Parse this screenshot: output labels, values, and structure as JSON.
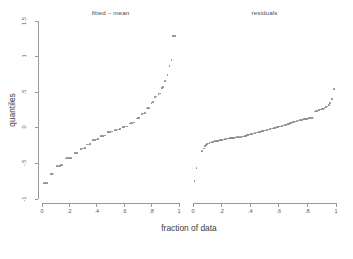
{
  "figure": {
    "y_axis_title": "quantiles",
    "x_axis_title": "fraction of data",
    "point_color": "#8e8e8e",
    "axis_color": "#9a9a9a"
  },
  "chart_data": {
    "type": "scatter",
    "title": "",
    "xlabel": "fraction of data",
    "ylabel": "quantiles",
    "xlim": [
      0,
      1
    ],
    "ylim": [
      -1,
      1.5
    ],
    "xticks": [
      0,
      0.2,
      0.4,
      0.6,
      0.8,
      1
    ],
    "xtick_labels": [
      "0",
      ".2",
      ".4",
      ".6",
      ".8",
      "1"
    ],
    "yticks": [
      -1,
      -0.5,
      0,
      0.5,
      1,
      1.5
    ],
    "ytick_labels": [
      "-1",
      "-.5",
      "0",
      ".5",
      "1",
      "1.5"
    ],
    "grid": false,
    "legend": "none",
    "panels": [
      {
        "label": "fitted – mean",
        "series_name": "fitted minus mean quantiles",
        "x": [
          0.01,
          0.02,
          0.03,
          0.04,
          0.065,
          0.075,
          0.085,
          0.11,
          0.12,
          0.13,
          0.14,
          0.15,
          0.175,
          0.185,
          0.195,
          0.205,
          0.215,
          0.24,
          0.25,
          0.26,
          0.285,
          0.295,
          0.305,
          0.315,
          0.33,
          0.34,
          0.35,
          0.37,
          0.38,
          0.39,
          0.4,
          0.41,
          0.43,
          0.44,
          0.45,
          0.46,
          0.48,
          0.49,
          0.5,
          0.51,
          0.53,
          0.54,
          0.55,
          0.56,
          0.57,
          0.59,
          0.6,
          0.61,
          0.62,
          0.64,
          0.65,
          0.66,
          0.67,
          0.69,
          0.7,
          0.71,
          0.73,
          0.74,
          0.75,
          0.765,
          0.775,
          0.785,
          0.8,
          0.81,
          0.825,
          0.835,
          0.85,
          0.86,
          0.875,
          0.885,
          0.9,
          0.915,
          0.93,
          0.945,
          0.955,
          0.965,
          0.975
        ],
        "y": [
          -0.775,
          -0.775,
          -0.775,
          -0.772,
          -0.645,
          -0.645,
          -0.643,
          -0.54,
          -0.538,
          -0.536,
          -0.52,
          -0.518,
          -0.43,
          -0.428,
          -0.426,
          -0.424,
          -0.422,
          -0.355,
          -0.353,
          -0.351,
          -0.295,
          -0.292,
          -0.29,
          -0.288,
          -0.235,
          -0.233,
          -0.23,
          -0.175,
          -0.172,
          -0.168,
          -0.165,
          -0.162,
          -0.118,
          -0.115,
          -0.112,
          -0.108,
          -0.06,
          -0.058,
          -0.055,
          -0.052,
          -0.03,
          -0.028,
          -0.025,
          -0.022,
          -0.02,
          0.012,
          0.015,
          0.018,
          0.02,
          0.06,
          0.065,
          0.07,
          0.075,
          0.13,
          0.135,
          0.14,
          0.195,
          0.2,
          0.205,
          0.27,
          0.275,
          0.282,
          0.35,
          0.36,
          0.43,
          0.44,
          0.47,
          0.48,
          0.56,
          0.575,
          0.66,
          0.745,
          0.87,
          0.95,
          1.285,
          1.29,
          1.292
        ]
      },
      {
        "label": "residuals",
        "series_name": "residual quantiles",
        "x": [
          0.01,
          0.025,
          0.065,
          0.075,
          0.085,
          0.092,
          0.1,
          0.108,
          0.115,
          0.122,
          0.13,
          0.138,
          0.145,
          0.153,
          0.16,
          0.168,
          0.175,
          0.183,
          0.19,
          0.198,
          0.205,
          0.213,
          0.22,
          0.228,
          0.235,
          0.243,
          0.25,
          0.258,
          0.265,
          0.273,
          0.28,
          0.288,
          0.295,
          0.303,
          0.31,
          0.318,
          0.325,
          0.333,
          0.34,
          0.348,
          0.355,
          0.363,
          0.37,
          0.378,
          0.385,
          0.393,
          0.4,
          0.408,
          0.415,
          0.423,
          0.43,
          0.438,
          0.445,
          0.453,
          0.46,
          0.468,
          0.475,
          0.483,
          0.49,
          0.498,
          0.505,
          0.513,
          0.52,
          0.528,
          0.535,
          0.543,
          0.55,
          0.558,
          0.565,
          0.573,
          0.58,
          0.588,
          0.595,
          0.603,
          0.61,
          0.618,
          0.625,
          0.633,
          0.64,
          0.648,
          0.655,
          0.663,
          0.67,
          0.678,
          0.685,
          0.693,
          0.7,
          0.708,
          0.715,
          0.723,
          0.73,
          0.738,
          0.745,
          0.753,
          0.76,
          0.768,
          0.775,
          0.783,
          0.79,
          0.798,
          0.805,
          0.813,
          0.82,
          0.828,
          0.835,
          0.843,
          0.85,
          0.86,
          0.87,
          0.88,
          0.89,
          0.9,
          0.91,
          0.92,
          0.93,
          0.94,
          0.95,
          0.96,
          0.97,
          0.985
        ],
        "y": [
          -0.75,
          -0.565,
          -0.325,
          -0.29,
          -0.26,
          -0.24,
          -0.228,
          -0.22,
          -0.212,
          -0.208,
          -0.2,
          -0.196,
          -0.192,
          -0.188,
          -0.186,
          -0.184,
          -0.182,
          -0.18,
          -0.176,
          -0.172,
          -0.168,
          -0.165,
          -0.162,
          -0.158,
          -0.155,
          -0.152,
          -0.15,
          -0.148,
          -0.146,
          -0.144,
          -0.142,
          -0.14,
          -0.138,
          -0.136,
          -0.134,
          -0.132,
          -0.13,
          -0.128,
          -0.126,
          -0.124,
          -0.122,
          -0.118,
          -0.112,
          -0.106,
          -0.1,
          -0.096,
          -0.092,
          -0.088,
          -0.084,
          -0.08,
          -0.076,
          -0.072,
          -0.068,
          -0.064,
          -0.06,
          -0.056,
          -0.052,
          -0.048,
          -0.044,
          -0.04,
          -0.036,
          -0.032,
          -0.028,
          -0.024,
          -0.02,
          -0.016,
          -0.012,
          -0.008,
          -0.004,
          0.0,
          0.004,
          0.008,
          0.012,
          0.016,
          0.02,
          0.024,
          0.028,
          0.032,
          0.036,
          0.04,
          0.046,
          0.052,
          0.058,
          0.064,
          0.07,
          0.076,
          0.082,
          0.086,
          0.09,
          0.094,
          0.098,
          0.102,
          0.106,
          0.11,
          0.113,
          0.116,
          0.119,
          0.122,
          0.125,
          0.128,
          0.131,
          0.134,
          0.137,
          0.14,
          0.142,
          0.144,
          0.23,
          0.235,
          0.24,
          0.248,
          0.256,
          0.262,
          0.268,
          0.276,
          0.29,
          0.3,
          0.32,
          0.35,
          0.4,
          0.545
        ]
      }
    ]
  }
}
